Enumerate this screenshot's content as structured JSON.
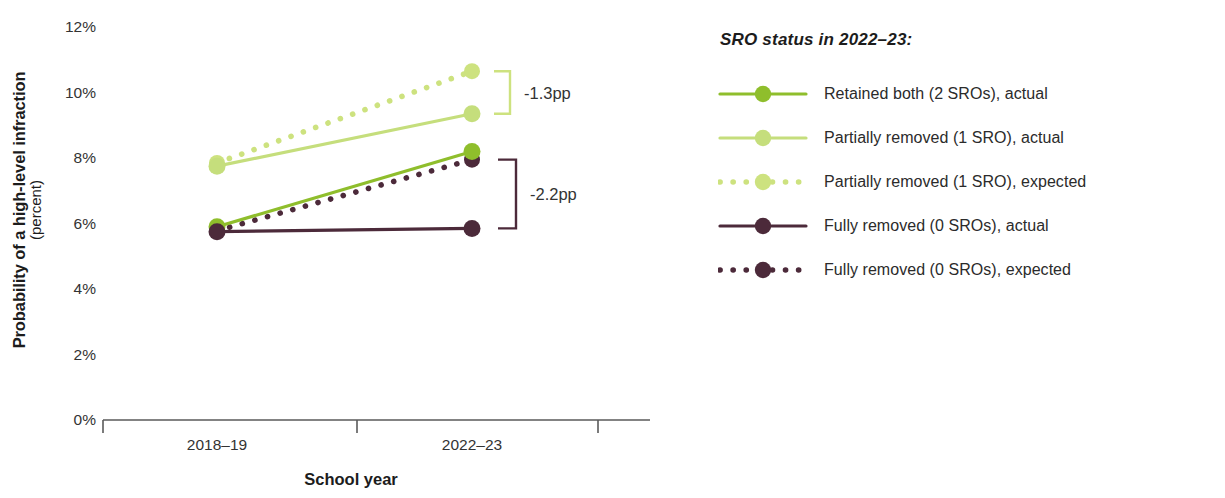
{
  "chart_data": {
    "type": "line",
    "title": "",
    "xlabel": "School year",
    "ylabel": "Probability of a high-level infraction",
    "ylabel_sub": "(percent)",
    "categories": [
      "2018–19",
      "2022–23"
    ],
    "ylim": [
      0,
      12
    ],
    "ytick_labels": [
      "0%",
      "2%",
      "4%",
      "6%",
      "8%",
      "10%",
      "12%"
    ],
    "ytick_values": [
      0,
      2,
      4,
      6,
      8,
      10,
      12
    ],
    "grid": false,
    "legend_position": "right",
    "series": [
      {
        "name": "Retained both (2 SROs), actual",
        "key": "retained_actual",
        "style": "solid",
        "color": "#8fbe2c",
        "values": [
          5.9,
          8.2
        ]
      },
      {
        "name": "Partially removed (1 SRO), actual",
        "key": "partial_actual",
        "style": "solid",
        "color": "#c5de7c",
        "values": [
          7.75,
          9.35
        ]
      },
      {
        "name": "Partially removed (1 SRO), expected",
        "key": "partial_expected",
        "style": "dotted",
        "color": "#cde27f",
        "values": [
          7.85,
          10.65
        ]
      },
      {
        "name": "Fully removed (0 SROs), actual",
        "key": "fully_actual",
        "style": "solid",
        "color": "#4c2a3a",
        "values": [
          5.75,
          5.85
        ]
      },
      {
        "name": "Fully removed (0 SROs), expected",
        "key": "fully_expected",
        "style": "dotted",
        "color": "#4c2a3a",
        "values": [
          5.78,
          7.95
        ]
      }
    ],
    "annotations": [
      {
        "label": "-1.3pp",
        "color": "#cde27f",
        "from_value": 10.65,
        "to_value": 9.35
      },
      {
        "label": "-2.2pp",
        "color": "#4c2a3a",
        "from_value": 7.95,
        "to_value": 5.85
      }
    ]
  },
  "legend": {
    "title": "SRO status in 2022–23:",
    "items": [
      {
        "label": "Retained both (2 SROs), actual",
        "color": "#8fbe2c",
        "style": "solid"
      },
      {
        "label": "Partially removed (1 SRO), actual",
        "color": "#c5de7c",
        "style": "solid"
      },
      {
        "label": "Partially removed (1 SRO), expected",
        "color": "#cde27f",
        "style": "dotted"
      },
      {
        "label": "Fully removed (0 SROs), actual",
        "color": "#4c2a3a",
        "style": "solid"
      },
      {
        "label": "Fully removed (0 SROs), expected",
        "color": "#4c2a3a",
        "style": "dotted"
      }
    ]
  },
  "axis": {
    "x_title": "School year",
    "y_title": "Probability of a high-level infraction",
    "y_subtitle": "(percent)",
    "x_tick_labels": [
      "2018–19",
      "2022–23"
    ],
    "y_tick_labels": [
      "12%",
      "10%",
      "8%",
      "6%",
      "4%",
      "2%",
      "0%"
    ]
  }
}
